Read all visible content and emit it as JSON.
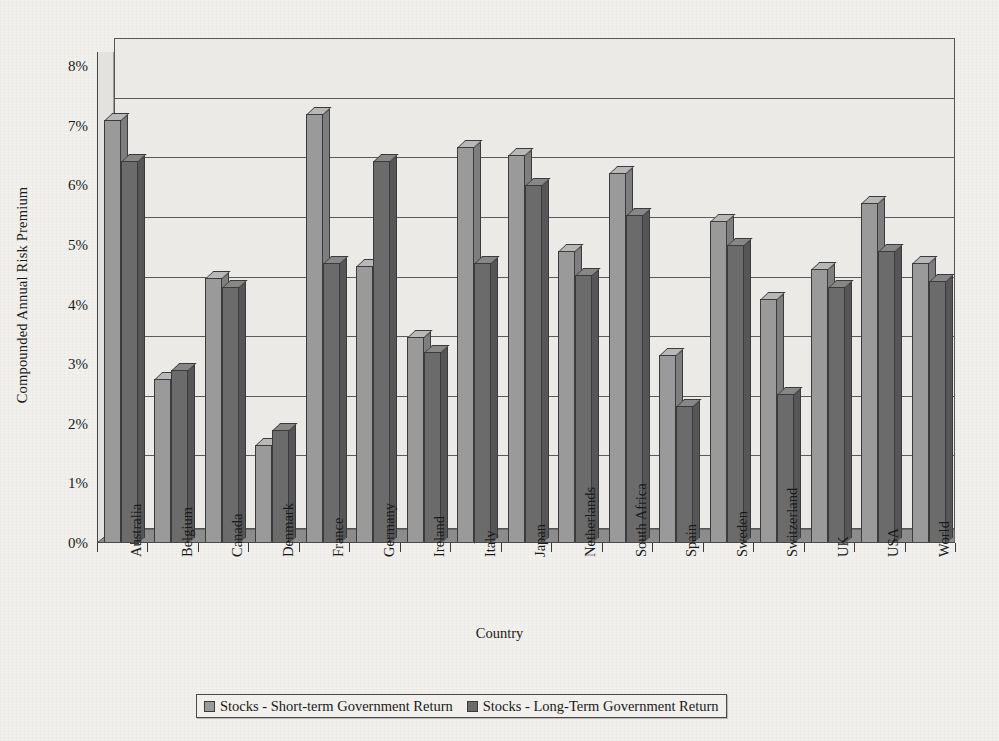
{
  "chart_data": {
    "type": "bar",
    "title": "",
    "xlabel": "Country",
    "ylabel": "Compounded Annual Risk Premium",
    "ylim": [
      0,
      8
    ],
    "ytick_labels": [
      "0%",
      "1%",
      "2%",
      "3%",
      "4%",
      "5%",
      "6%",
      "7%",
      "8%"
    ],
    "ytick_values": [
      0,
      1,
      2,
      3,
      4,
      5,
      6,
      7,
      8
    ],
    "grid": true,
    "legend_position": "bottom",
    "categories": [
      "Australia",
      "Belgium",
      "Canada",
      "Denmark",
      "France",
      "Germany",
      "Ireland",
      "Italy",
      "Japan",
      "Netherlands",
      "South Africa",
      "Spain",
      "Sweden",
      "Switzerland",
      "UK",
      "USA",
      "World"
    ],
    "series": [
      {
        "name": "Stocks - Short-term Government Return",
        "color": "#9a9a9a",
        "values": [
          7.1,
          2.75,
          4.45,
          1.65,
          7.2,
          4.65,
          3.45,
          6.65,
          6.5,
          4.9,
          6.2,
          3.15,
          5.4,
          4.1,
          4.6,
          5.7,
          4.7
        ]
      },
      {
        "name": "Stocks - Long-Term Government Return",
        "color": "#6b6b6b",
        "values": [
          6.4,
          2.9,
          4.3,
          1.9,
          4.7,
          6.4,
          3.2,
          4.7,
          6.0,
          4.5,
          5.5,
          2.3,
          5.0,
          2.5,
          4.3,
          4.9,
          4.4
        ]
      }
    ]
  },
  "legend": {
    "items": [
      {
        "label": "Stocks - Short-term Government Return"
      },
      {
        "label": "Stocks - Long-Term Government Return"
      }
    ]
  }
}
